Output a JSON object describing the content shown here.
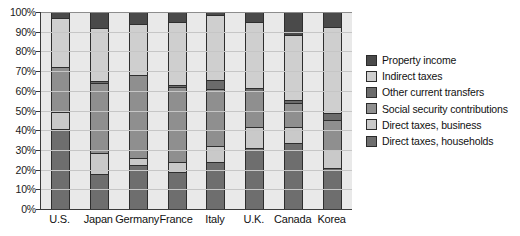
{
  "chart_data": {
    "type": "bar",
    "subtype": "stacked-bar-100-percent",
    "title": "",
    "xlabel": "",
    "ylabel": "",
    "ylim": [
      0,
      100
    ],
    "ytick_labels": [
      "100%",
      "90%",
      "80%",
      "70%",
      "60%",
      "50%",
      "40%",
      "30%",
      "20%",
      "10%",
      "0%"
    ],
    "ytick_values": [
      100,
      90,
      80,
      70,
      60,
      50,
      40,
      30,
      20,
      10,
      0
    ],
    "grid": true,
    "legend_position": "right",
    "categories": [
      "U.S.",
      "Japan",
      "Germany",
      "France",
      "Italy",
      "U.K.",
      "Canada",
      "Korea"
    ],
    "series": [
      {
        "name": "Direct taxes, households",
        "color": "#6e6e6e",
        "values": [
          40.5,
          18.0,
          22.5,
          19.0,
          24.0,
          31.0,
          33.5,
          21.0
        ]
      },
      {
        "name": "Direct taxes, business",
        "color": "#c9c9c9",
        "values": [
          9.0,
          10.5,
          3.5,
          5.0,
          8.0,
          10.5,
          8.0,
          9.0
        ]
      },
      {
        "name": "Social security contributions",
        "color": "#8f8f8f",
        "values": [
          22.5,
          35.5,
          42.0,
          38.0,
          29.0,
          18.5,
          12.5,
          15.0
        ]
      },
      {
        "name": "Other current transfers",
        "color": "#6b6b6b",
        "values": [
          0.0,
          1.0,
          0.0,
          1.0,
          4.5,
          1.5,
          1.5,
          3.5
        ]
      },
      {
        "name": "Indirect taxes",
        "color": "#cfcfcf",
        "values": [
          25.0,
          27.0,
          26.0,
          32.0,
          33.0,
          33.5,
          33.0,
          44.0
        ]
      },
      {
        "name": "Property income",
        "color": "#4a4a4a",
        "values": [
          3.0,
          8.0,
          6.0,
          5.0,
          1.5,
          5.0,
          11.5,
          7.5
        ]
      }
    ],
    "legend_order": [
      "Property income",
      "Indirect taxes",
      "Other current transfers",
      "Social security contributions",
      "Direct taxes, business",
      "Direct taxes, households"
    ],
    "colors": {
      "property_income": "#4a4a4a",
      "indirect_taxes": "#cfcfcf",
      "other_current_transfers": "#6b6b6b",
      "social_security_contributions": "#8f8f8f",
      "direct_taxes_business": "#c9c9c9",
      "direct_taxes_households": "#6e6e6e",
      "plot_background": "#e9e9e9",
      "gridline": "#c6c6c6",
      "axis": "#3a3a3a",
      "segment_outline": "#2e2e2e"
    }
  }
}
